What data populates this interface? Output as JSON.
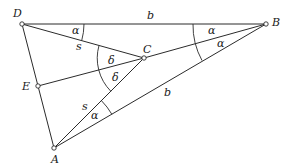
{
  "diagram": {
    "type": "geometry-figure",
    "points": {
      "D": {
        "label": "D"
      },
      "B": {
        "label": "B"
      },
      "C": {
        "label": "C"
      },
      "E": {
        "label": "E"
      },
      "A": {
        "label": "A"
      }
    },
    "segment_labels": {
      "DB": "b",
      "DC": "s",
      "AC": "s",
      "AB": "b"
    },
    "angle_labels": {
      "at_D": "α",
      "at_B_upper": "α",
      "at_B_lower": "α",
      "at_A": "α",
      "at_C_upper": "δ",
      "at_C_lower": "δ"
    },
    "colors": {
      "stroke": "#2b2b2b",
      "background": "#ffffff"
    }
  }
}
